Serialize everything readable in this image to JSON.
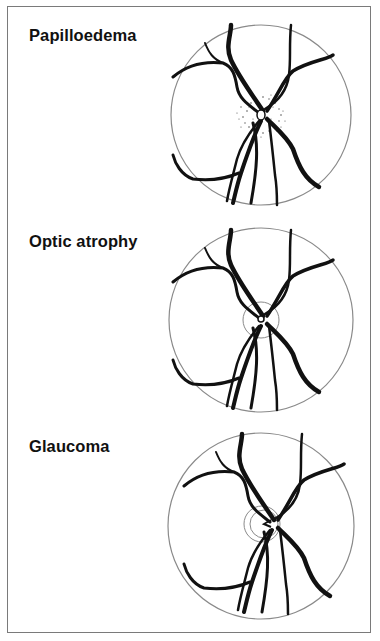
{
  "figure": {
    "panels": [
      {
        "id": "papilloedema",
        "label": "Papilloedema",
        "disc_feature": "swollen disc with blurred, stippled margins and haemorrhage-like dots"
      },
      {
        "id": "optic-atrophy",
        "label": "Optic atrophy",
        "disc_feature": "pale disc with sharply defined margin"
      },
      {
        "id": "glaucoma",
        "label": "Glaucoma",
        "disc_feature": "deep cupping with vessels bending over cup edge"
      }
    ],
    "colors": {
      "frame": "#7a7a7a",
      "vessel": "#111111",
      "outline": "#8a8a8a",
      "stipple": "#555555"
    }
  }
}
